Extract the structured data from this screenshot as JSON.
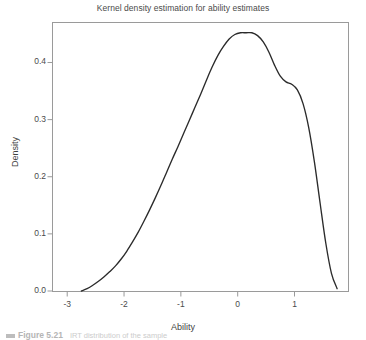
{
  "chart_data": {
    "type": "line",
    "title": "Kernel density estimation for ability estimates",
    "xlabel": "Ability",
    "ylabel": "Density",
    "xlim": [
      -3.25,
      1.95
    ],
    "ylim": [
      0.0,
      0.47
    ],
    "grid": false,
    "legend": null,
    "x_ticks": [
      "-3",
      "-2",
      "-1",
      "0",
      "1"
    ],
    "x_tick_values": [
      -3,
      -2,
      -1,
      0,
      1
    ],
    "y_ticks": [
      "0.0",
      "0.1",
      "0.2",
      "0.3",
      "0.4"
    ],
    "y_tick_values": [
      0.0,
      0.1,
      0.2,
      0.3,
      0.4
    ],
    "series": [
      {
        "name": "Kernel density",
        "color": "#2b2b2b",
        "x": [
          -2.75,
          -2.65,
          -2.55,
          -2.45,
          -2.35,
          -2.25,
          -2.15,
          -2.05,
          -1.95,
          -1.85,
          -1.75,
          -1.65,
          -1.55,
          -1.45,
          -1.35,
          -1.25,
          -1.15,
          -1.05,
          -0.95,
          -0.85,
          -0.75,
          -0.65,
          -0.55,
          -0.45,
          -0.35,
          -0.25,
          -0.15,
          -0.05,
          0.05,
          0.15,
          0.25,
          0.35,
          0.45,
          0.55,
          0.65,
          0.75,
          0.85,
          0.95,
          1.05,
          1.15,
          1.25,
          1.35,
          1.45,
          1.55,
          1.65,
          1.75
        ],
        "y": [
          0.0,
          0.004,
          0.01,
          0.017,
          0.025,
          0.034,
          0.044,
          0.056,
          0.07,
          0.086,
          0.103,
          0.122,
          0.142,
          0.163,
          0.185,
          0.208,
          0.231,
          0.253,
          0.276,
          0.299,
          0.322,
          0.345,
          0.369,
          0.392,
          0.412,
          0.428,
          0.441,
          0.449,
          0.452,
          0.452,
          0.452,
          0.447,
          0.436,
          0.418,
          0.395,
          0.376,
          0.366,
          0.362,
          0.352,
          0.328,
          0.286,
          0.226,
          0.154,
          0.084,
          0.031,
          0.004
        ],
        "peak": {
          "x": 0.25,
          "y": 0.452
        },
        "shoulder": {
          "x": 0.88,
          "y": 0.364
        }
      }
    ],
    "frame_color": "#9a9a9a",
    "background": "#ffffff"
  },
  "caption": {
    "bar": "",
    "label": "Figure 5.21",
    "text": "IRT distribution of the sample"
  }
}
